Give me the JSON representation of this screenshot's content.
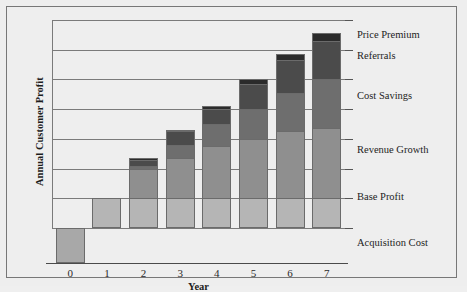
{
  "chart_data": {
    "type": "bar",
    "subtype": "stacked-bar",
    "title": "",
    "subtitle": "",
    "xlabel": "Year",
    "ylabel": "Annual Customer Profit",
    "categories": [
      "0",
      "1",
      "2",
      "3",
      "4",
      "5",
      "6",
      "7"
    ],
    "xtick_labels": [
      "0",
      "1",
      "2",
      "3",
      "4",
      "5",
      "6",
      "7"
    ],
    "ylim": [
      -1,
      7
    ],
    "yticks": [
      -1,
      0,
      1,
      2,
      3,
      4,
      5,
      6,
      7
    ],
    "y_tick_labels_shown": false,
    "grid": true,
    "grid_axis": "y",
    "legend_position": "right-inline-labels",
    "series": [
      {
        "name": "Acquisition Cost",
        "color": "#a8a8a8",
        "values": [
          -1.0,
          0,
          0,
          0,
          0,
          0,
          0,
          0
        ]
      },
      {
        "name": "Base Profit",
        "color": "#b5b5b5",
        "values": [
          0,
          1.0,
          1.0,
          1.0,
          1.0,
          1.0,
          1.0,
          1.0
        ]
      },
      {
        "name": "Revenue Growth",
        "color": "#8f8f8f",
        "values": [
          0,
          0,
          1.0,
          1.35,
          1.75,
          2.0,
          2.25,
          2.35
        ]
      },
      {
        "name": "Cost Savings",
        "color": "#6e6e6e",
        "values": [
          0,
          0,
          0.1,
          0.45,
          0.75,
          1.0,
          1.3,
          1.65
        ]
      },
      {
        "name": "Referrals",
        "color": "#4b4b4b",
        "values": [
          0,
          0,
          0.2,
          0.45,
          0.5,
          0.85,
          1.1,
          1.3
        ]
      },
      {
        "name": "Price Premium",
        "color": "#2b2b2b",
        "values": [
          0,
          0,
          0.05,
          0.05,
          0.1,
          0.15,
          0.2,
          0.25
        ]
      }
    ],
    "totals": [
      -1.0,
      1.0,
      2.35,
      3.3,
      4.1,
      5.0,
      5.85,
      6.55
    ],
    "annotations": [
      {
        "text": "Price Premium",
        "y": 6.45
      },
      {
        "text": "Referrals",
        "y": 5.75
      },
      {
        "text": "Cost Savings",
        "y": 4.4
      },
      {
        "text": "Revenue Growth",
        "y": 2.6
      },
      {
        "text": "Base Profit",
        "y": 1.0
      },
      {
        "text": "Acquisition Cost",
        "y": -0.55
      }
    ]
  },
  "figure": {
    "background_color": "#eeeeee",
    "frame_color": "#777777",
    "axis_color": "#4a4a4a",
    "grid_color": "#7a7a7a"
  }
}
